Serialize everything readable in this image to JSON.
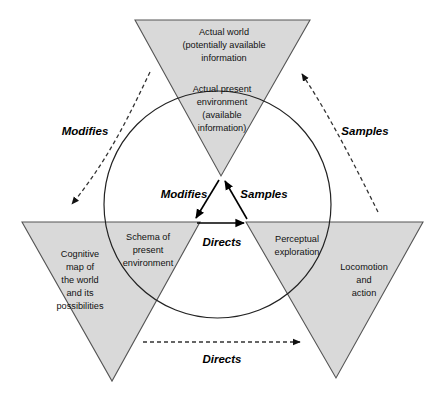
{
  "diagram": {
    "style": {
      "triangle_fill": "#d9d9d9",
      "triangle_stroke": "#555555",
      "circle_stroke": "#222222",
      "arrow_color": "#000000",
      "background": "#ffffff",
      "text_color": "#111111"
    },
    "outer_nodes": [
      {
        "id": "actual-world",
        "position": "top",
        "lines": [
          "Actual world",
          "(potentially available",
          "information"
        ]
      },
      {
        "id": "cognitive-map",
        "position": "bottom-left",
        "lines": [
          "Cognitive",
          "map of",
          "the world",
          "and its",
          "possibilities"
        ]
      },
      {
        "id": "locomotion-and-action",
        "position": "bottom-right",
        "lines": [
          "Locomotion",
          "and",
          "action"
        ]
      }
    ],
    "inner_nodes": [
      {
        "id": "actual-present-environment",
        "position": "top",
        "lines": [
          "Actual present",
          "environment",
          "(available",
          "information)"
        ]
      },
      {
        "id": "schema-of-present-environment",
        "position": "bottom-left",
        "lines": [
          "Schema of",
          "present",
          "environment"
        ]
      },
      {
        "id": "perceptual-exploration",
        "position": "bottom-right",
        "lines": [
          "Perceptual",
          "exploration"
        ]
      }
    ],
    "inner_relations": [
      {
        "id": "inner-modifies",
        "label": "Modifies"
      },
      {
        "id": "inner-samples",
        "label": "Samples"
      },
      {
        "id": "inner-directs",
        "label": "Directs"
      }
    ],
    "outer_relations": [
      {
        "id": "outer-modifies",
        "label": "Modifies"
      },
      {
        "id": "outer-samples",
        "label": "Samples"
      },
      {
        "id": "outer-directs",
        "label": "Directs"
      }
    ]
  }
}
